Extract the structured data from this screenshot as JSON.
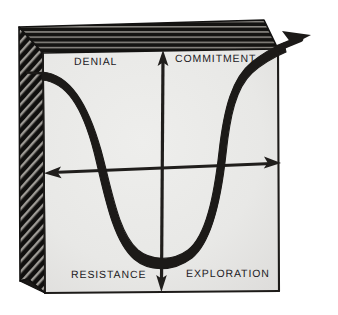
{
  "figure": {
    "page_background": "#ffffff",
    "paper_face_color": "#e8e8e6",
    "ink_color": "#23211f",
    "panel_dark_color": "#1b1917"
  },
  "labels": {
    "top_left": "DENIAL",
    "top_right": "COMMITMENT",
    "bottom_left": "RESISTANCE",
    "bottom_right": "EXPLORATION"
  },
  "axes": {
    "vertical": {
      "name": "vertical-axis",
      "arrow_top": true,
      "arrow_bottom": true
    },
    "horizontal": {
      "name": "horizontal-axis",
      "arrow_left": true,
      "arrow_right": true
    }
  },
  "curve": {
    "name": "change-curve",
    "shape": "J-curve",
    "arrow_end": "top-right",
    "stages": [
      "DENIAL",
      "RESISTANCE",
      "EXPLORATION",
      "COMMITMENT"
    ]
  },
  "box": {
    "name": "three-d-box",
    "faces": [
      "front",
      "left-side",
      "top"
    ]
  }
}
